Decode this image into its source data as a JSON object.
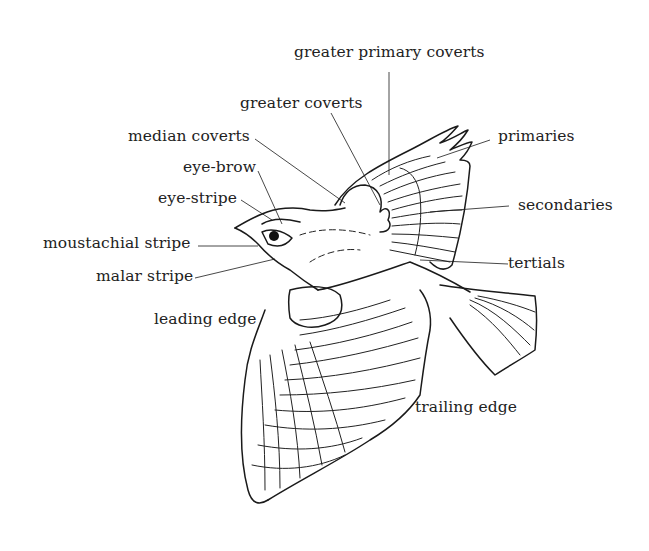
{
  "diagram": {
    "labels": {
      "greater_primary_coverts": "greater primary coverts",
      "greater_coverts": "greater coverts",
      "median_coverts": "median coverts",
      "eye_brow": "eye-brow",
      "eye_stripe": "eye-stripe",
      "moustachial_stripe": "moustachial stripe",
      "malar_stripe": "malar stripe",
      "leading_edge": "leading edge",
      "primaries": "primaries",
      "secondaries": "secondaries",
      "tertials": "tertials",
      "trailing_edge": "trailing edge"
    },
    "colors": {
      "ink": "#1a1a1a",
      "background": "#ffffff"
    }
  }
}
